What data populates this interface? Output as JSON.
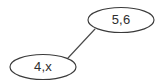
{
  "diagram": {
    "type": "node-link-graph",
    "background_color": "#ffffff",
    "stroke_color": "#3a3a3a",
    "text_color": "#2e2e2e",
    "nodes": [
      {
        "id": "node-top",
        "label": "5,6",
        "shape": "ellipse",
        "cx": 121,
        "cy": 20,
        "rx": 33,
        "ry": 12.5
      },
      {
        "id": "node-bottom",
        "label": "4,x",
        "shape": "ellipse",
        "cx": 43,
        "cy": 67,
        "rx": 33,
        "ry": 12.5
      }
    ],
    "edges": [
      {
        "id": "edge-top-bottom",
        "from": "node-top",
        "to": "node-bottom",
        "x1": 95,
        "y1": 29,
        "x2": 68,
        "y2": 58
      }
    ]
  }
}
